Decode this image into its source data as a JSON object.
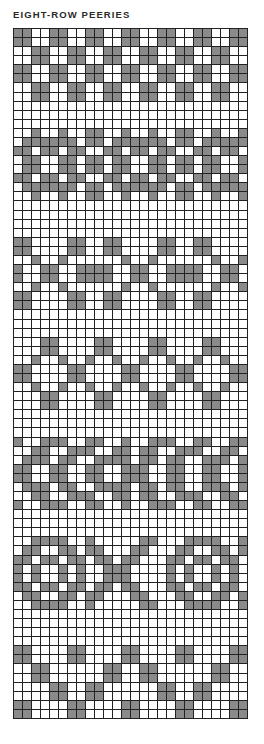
{
  "title": "EIGHT-ROW PEERIES",
  "chart": {
    "columns": 26,
    "rows": 76,
    "colors": {
      "filled": "#8a8a8a",
      "empty": "#ffffff",
      "grid_line": "#222222"
    },
    "legend": {
      "X": "contrast colour (filled)",
      ".": "background (empty)"
    },
    "grid": [
      "XX..XX..XX..XX..XX..XX..XX",
      "XX..XX..XX..XX..XX..XX..XX",
      "..XX..XX..XX..XX..XX..XX..",
      "..XX..XX..XX..XX..XX..XX..",
      "XX..XX..XX..XX..XX..XX..XX",
      "XX..XX..XX..XX..XX..XX..XX",
      "..XX..XX..XX..XX..XX..XX..",
      "..XX..XX..XX..XX..XX..XX..",
      "..........................",
      "..........................",
      "..........................",
      "..X..X..XX..X..X..XX..X..X",
      ".XXXXXX.XX.XXXXXX.XX.XXXXX",
      "XX.XX.XX..XX.XX.XX..XX.XX.",
      ".XX..XX.XX.XX..XX.XX.XX..X",
      ".XX..XX.XX.XX..XX.XX.XX..X",
      "XX.XX.XX..XX.XX.XX..XX.XX.",
      ".XXXXXX.XX.XXXXXX.XX.XXXXX",
      "..X..X..XX..X..X..XX..X..X",
      "..........................",
      "..........................",
      "..........................",
      "..........................",
      "XX....XX..XX....XX..XX....",
      "XX....XX..XX....XX..XX....",
      "..X..X......X..X......X..X",
      "X..XX..XXXX..XX..XXXX..XX.",
      "X..XX..XXXX..XX..XXXX..XX.",
      "..X..X......X..X......X..X",
      "XX....XX..XX....XX..XX....",
      "XX....XX..XX....XX..XX....",
      "..........................",
      "..........................",
      "..........................",
      "...XX....XX....XX....XX...",
      "...XX....XX....XX....XX...",
      "..X..X..X..X..X..X..X..X..",
      "XX....XX....XX....XX....XX",
      "XX....XX....XX....XX....XX",
      "..X..X..X..X..X..X..X..X..",
      "...XX....XX....XX....XX...",
      "...XX....XX....XX....XX...",
      "..........................",
      "..........................",
      "..........................",
      "X..XXX..XX..X..XXX..XX..XX",
      "..XX..XXX..XX.XX..XXX..XX.",
      ".XXX.XX..XXXX.XX.XX..XXX.X",
      "XX..XX..XX..XXX..XX..XX..X",
      "XX..XX..XX..XXX..XX..XX..X",
      ".XXX.XX..XXXX.XX.XX..XXX.X",
      "..XX..XXX..XX.XX..XXX..XX.",
      "X..XXX..XX..X..XXX..XX..XX",
      "..........................",
      "..........................",
      "..........................",
      "..XXXX..X.....XX...XXXX..X",
      ".XX..XX.XX...XX...XX..XX.X",
      "XX.XX.XX.XX.XX...XX.XX.XX.",
      "X.X..X.X..XXX....X.X..X.X.",
      "X.X..X.X..XXX....X.X..X.X.",
      "XX.XX.XX.XX.XX...XX.XX.XX.",
      ".XX..XX.XX...XX...XX..XX.X",
      "..XXXX..X.....XX...XXXX..X",
      "..........................",
      "..........................",
      "..........................",
      "..........................",
      "XX....XX....XX....XX....XX",
      "XX....XX....XX....XX....XX",
      "..XX......XX..XX......XX..",
      "..XX......XX..XX......XX..",
      "....XX..XX......XX..XX....",
      "....XX..XX......XX..XX....",
      "XX....XX....XX....XX....XX",
      "XX....XX....XX....XX....XX"
    ]
  }
}
